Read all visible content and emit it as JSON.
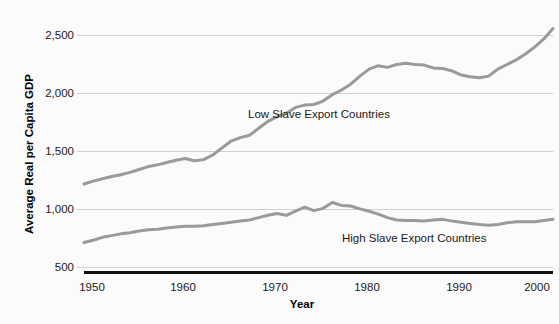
{
  "chart_data": {
    "type": "line",
    "title": "",
    "xlabel": "Year",
    "ylabel": "Average Real per Capita GDP",
    "xlim": [
      1950,
      2001
    ],
    "ylim": [
      500,
      2650
    ],
    "xticks": [
      "1950",
      "1960",
      "1970",
      "1980",
      "1990",
      "2000"
    ],
    "xtick_values": [
      1950,
      1960,
      1970,
      1980,
      1990,
      2000
    ],
    "yticks": [
      "500",
      "1,000",
      "1,500",
      "2,000",
      "2,500"
    ],
    "ytick_values": [
      500,
      1000,
      1500,
      2000,
      2500
    ],
    "grid": true,
    "legend_position": "inline-annotations",
    "line_color": "#9a9a9a",
    "background_color": "#fbfbfb",
    "x": [
      1950,
      1951,
      1952,
      1953,
      1954,
      1955,
      1956,
      1957,
      1958,
      1959,
      1960,
      1961,
      1962,
      1963,
      1964,
      1965,
      1966,
      1967,
      1968,
      1969,
      1970,
      1971,
      1972,
      1973,
      1974,
      1975,
      1976,
      1977,
      1978,
      1979,
      1980,
      1981,
      1982,
      1983,
      1984,
      1985,
      1986,
      1987,
      1988,
      1989,
      1990,
      1991,
      1992,
      1993,
      1994,
      1995,
      1996,
      1997,
      1998,
      1999,
      2000,
      2001
    ],
    "series": [
      {
        "name": "Low Slave Export Countries",
        "annotation": "Low Slave Export Countries",
        "values": [
          1220,
          1245,
          1265,
          1285,
          1300,
          1320,
          1345,
          1370,
          1385,
          1405,
          1425,
          1440,
          1420,
          1430,
          1470,
          1530,
          1590,
          1620,
          1640,
          1700,
          1760,
          1800,
          1830,
          1880,
          1900,
          1905,
          1935,
          1990,
          2030,
          2080,
          2150,
          2210,
          2240,
          2225,
          2250,
          2260,
          2250,
          2245,
          2220,
          2215,
          2195,
          2160,
          2145,
          2135,
          2150,
          2210,
          2250,
          2290,
          2340,
          2400,
          2470,
          2560
        ]
      },
      {
        "name": "High Slave Export Countries",
        "annotation": "High Slave Export Countries",
        "values": [
          715,
          735,
          760,
          775,
          790,
          800,
          815,
          825,
          830,
          840,
          850,
          855,
          855,
          860,
          870,
          880,
          890,
          900,
          910,
          930,
          950,
          965,
          950,
          985,
          1020,
          990,
          1010,
          1060,
          1035,
          1030,
          1005,
          985,
          960,
          930,
          910,
          905,
          905,
          900,
          910,
          915,
          900,
          890,
          880,
          870,
          865,
          870,
          885,
          895,
          895,
          895,
          905,
          915
        ]
      }
    ],
    "annotations": [
      {
        "text": "Low Slave Export Countries",
        "x_px": 248,
        "y_px": 118
      },
      {
        "text": "High Slave Export Countries",
        "x_px": 342,
        "y_px": 242
      }
    ]
  }
}
